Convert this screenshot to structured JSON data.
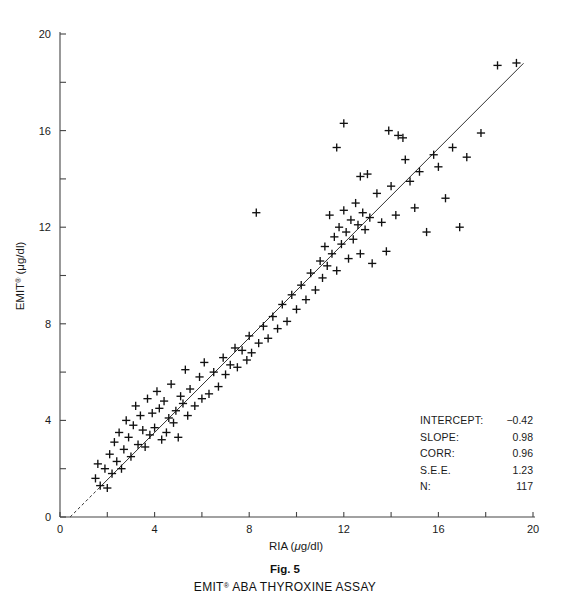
{
  "figure": {
    "number_label": "Fig. 5",
    "caption": "EMIT® ABA THYROXINE ASSAY",
    "caption_main": "EMIT",
    "caption_sup": "®",
    "caption_rest": " ABA THYROXINE ASSAY"
  },
  "stats": {
    "rows": [
      {
        "label": "INTERCEPT:",
        "value": "−0.42"
      },
      {
        "label": "SLOPE:",
        "value": "0.98"
      },
      {
        "label": "CORR:",
        "value": "0.96"
      },
      {
        "label": "S.E.E.",
        "value": "1.23"
      },
      {
        "label": "N:",
        "value": "117"
      }
    ]
  },
  "chart_data": {
    "type": "scatter",
    "title": "EMIT® ABA THYROXINE ASSAY",
    "xlabel": "RIA (μg/dl)",
    "ylabel": "EMIT® (μg/dl)",
    "xlabel_parts": {
      "main": "RIA (",
      "italic": "μ",
      "rest": "g/dl)"
    },
    "ylabel_parts": {
      "main": "EMIT",
      "sup": "®",
      "rest": " (μg/dl)"
    },
    "xlim": [
      0,
      20
    ],
    "ylim": [
      0,
      20
    ],
    "xticks": [
      0,
      2,
      4,
      6,
      8,
      10,
      12,
      14,
      16,
      18,
      20
    ],
    "yticks": [
      0,
      2,
      4,
      6,
      8,
      10,
      12,
      14,
      16,
      18,
      20
    ],
    "xticklabels": {
      "0": "0",
      "4": "4",
      "8": "8",
      "12": "12",
      "16": "16",
      "20": "20"
    },
    "yticklabels": {
      "0": "0",
      "4": "4",
      "8": "8",
      "12": "12",
      "16": "16",
      "20": "20"
    },
    "grid": false,
    "legend": false,
    "marker": "plus",
    "marker_color": "#111111",
    "line_color": "#333333",
    "fit_line": {
      "type": "linear",
      "slope": 0.98,
      "intercept": -0.42,
      "x_start": 0.43,
      "x_end": 19.6,
      "dashed_below_x": 1.6
    },
    "statistics": {
      "intercept": -0.42,
      "slope": 0.98,
      "correlation": 0.96,
      "see": 1.23,
      "n": 117
    },
    "points": [
      [
        1.5,
        1.6
      ],
      [
        1.6,
        2.2
      ],
      [
        1.7,
        1.3
      ],
      [
        1.9,
        2.0
      ],
      [
        2.0,
        1.2
      ],
      [
        2.1,
        2.6
      ],
      [
        2.2,
        1.8
      ],
      [
        2.3,
        3.1
      ],
      [
        2.4,
        2.3
      ],
      [
        2.5,
        3.5
      ],
      [
        2.6,
        2.0
      ],
      [
        2.7,
        2.8
      ],
      [
        2.8,
        4.0
      ],
      [
        2.9,
        3.3
      ],
      [
        3.0,
        2.5
      ],
      [
        3.1,
        3.8
      ],
      [
        3.2,
        4.6
      ],
      [
        3.3,
        3.0
      ],
      [
        3.4,
        4.2
      ],
      [
        3.5,
        3.6
      ],
      [
        3.6,
        2.9
      ],
      [
        3.7,
        4.9
      ],
      [
        3.8,
        3.4
      ],
      [
        3.9,
        4.3
      ],
      [
        4.0,
        3.7
      ],
      [
        4.1,
        5.2
      ],
      [
        4.2,
        4.5
      ],
      [
        4.3,
        3.2
      ],
      [
        4.4,
        4.8
      ],
      [
        4.5,
        3.5
      ],
      [
        4.6,
        4.1
      ],
      [
        4.7,
        5.5
      ],
      [
        4.8,
        3.9
      ],
      [
        4.9,
        4.4
      ],
      [
        5.0,
        3.3
      ],
      [
        5.1,
        5.0
      ],
      [
        5.2,
        4.7
      ],
      [
        5.3,
        6.1
      ],
      [
        5.4,
        4.2
      ],
      [
        5.5,
        5.3
      ],
      [
        5.7,
        4.6
      ],
      [
        5.9,
        5.8
      ],
      [
        6.0,
        4.9
      ],
      [
        6.1,
        6.4
      ],
      [
        6.3,
        5.1
      ],
      [
        6.5,
        6.0
      ],
      [
        6.7,
        5.4
      ],
      [
        6.9,
        6.6
      ],
      [
        7.0,
        5.9
      ],
      [
        7.2,
        6.3
      ],
      [
        7.4,
        7.0
      ],
      [
        7.5,
        6.2
      ],
      [
        7.7,
        6.9
      ],
      [
        7.9,
        6.5
      ],
      [
        8.0,
        7.5
      ],
      [
        8.1,
        6.8
      ],
      [
        8.3,
        12.6
      ],
      [
        8.4,
        7.2
      ],
      [
        8.6,
        7.9
      ],
      [
        8.8,
        7.4
      ],
      [
        9.0,
        8.3
      ],
      [
        9.2,
        7.8
      ],
      [
        9.4,
        8.8
      ],
      [
        9.6,
        8.1
      ],
      [
        9.8,
        9.2
      ],
      [
        10.0,
        8.6
      ],
      [
        10.2,
        9.6
      ],
      [
        10.4,
        9.0
      ],
      [
        10.6,
        10.1
      ],
      [
        10.8,
        9.4
      ],
      [
        11.0,
        10.6
      ],
      [
        11.1,
        9.9
      ],
      [
        11.2,
        11.2
      ],
      [
        11.3,
        10.4
      ],
      [
        11.4,
        12.5
      ],
      [
        11.5,
        10.9
      ],
      [
        11.6,
        11.6
      ],
      [
        11.7,
        10.2
      ],
      [
        11.8,
        12.0
      ],
      [
        11.9,
        11.3
      ],
      [
        12.0,
        12.7
      ],
      [
        12.1,
        11.8
      ],
      [
        12.2,
        10.7
      ],
      [
        12.3,
        12.3
      ],
      [
        12.4,
        11.5
      ],
      [
        12.5,
        13.0
      ],
      [
        12.6,
        12.1
      ],
      [
        12.7,
        10.9
      ],
      [
        12.8,
        12.6
      ],
      [
        12.9,
        11.9
      ],
      [
        13.0,
        14.2
      ],
      [
        13.1,
        12.4
      ],
      [
        13.2,
        10.5
      ],
      [
        13.4,
        13.4
      ],
      [
        13.6,
        12.2
      ],
      [
        13.8,
        11.0
      ],
      [
        14.0,
        13.7
      ],
      [
        14.2,
        12.5
      ],
      [
        14.5,
        15.7
      ],
      [
        14.6,
        14.8
      ],
      [
        14.8,
        13.9
      ],
      [
        15.0,
        12.8
      ],
      [
        15.2,
        14.3
      ],
      [
        15.5,
        11.8
      ],
      [
        15.8,
        15.0
      ],
      [
        16.0,
        14.5
      ],
      [
        16.3,
        13.2
      ],
      [
        16.6,
        15.3
      ],
      [
        16.9,
        12.0
      ],
      [
        17.2,
        14.9
      ],
      [
        11.7,
        15.3
      ],
      [
        12.0,
        16.3
      ],
      [
        12.7,
        14.1
      ],
      [
        13.9,
        16.0
      ],
      [
        14.3,
        15.8
      ],
      [
        17.8,
        15.9
      ],
      [
        18.5,
        18.7
      ],
      [
        19.3,
        18.8
      ]
    ]
  }
}
